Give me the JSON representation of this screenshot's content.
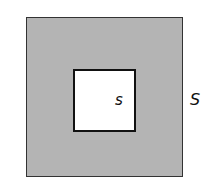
{
  "diagram": {
    "outer_square": {
      "label": "S",
      "fill": "#b4b4b4"
    },
    "inner_square": {
      "label": "s",
      "fill": "#ffffff"
    }
  }
}
